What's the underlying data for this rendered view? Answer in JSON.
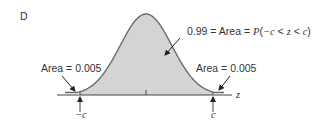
{
  "figure": {
    "panel_label": "D",
    "center_annotation": {
      "value": "0.99",
      "eq1": " = ",
      "area_word": "Area",
      "eq2": " = ",
      "p_func": "P",
      "open": "(",
      "neg_c": "−c",
      "lt1": " < ",
      "z": "z",
      "lt2": " < ",
      "c": "c",
      "close": ")"
    },
    "left_tail_label": "Area = 0.005",
    "right_tail_label": "Area = 0.005",
    "axis_label": "z",
    "left_bound_label": "−c",
    "right_bound_label": "c",
    "colors": {
      "fill": "#d4d4d4",
      "curve": "#6a6a6a",
      "axis": "#444444",
      "text": "#333333"
    }
  },
  "chart_data": {
    "type": "area",
    "title": "",
    "distribution": "standard normal",
    "shaded_region": {
      "from": "-c",
      "to": "c",
      "area": 0.99
    },
    "tails": [
      {
        "side": "left",
        "region": "z < -c",
        "area": 0.005
      },
      {
        "side": "right",
        "region": "z > c",
        "area": 0.005
      }
    ],
    "xlabel": "z",
    "x_ticks": [
      "-c",
      "0",
      "c"
    ],
    "c_value_approx": 2.576
  }
}
